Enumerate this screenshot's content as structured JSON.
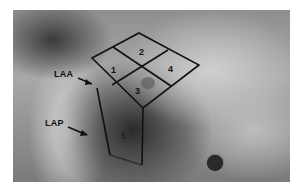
{
  "figure": {
    "labels": {
      "laa": "LAA",
      "lap": "LAP"
    },
    "regions": [
      "1",
      "2",
      "3",
      "4",
      "5"
    ],
    "colors": {
      "grid_line": "#111111",
      "border": "#ffffff"
    }
  }
}
